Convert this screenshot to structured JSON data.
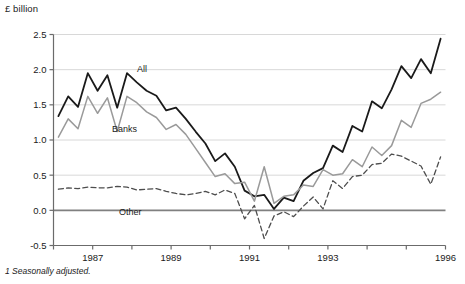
{
  "figure": {
    "unit_label": "£ billion",
    "footnote": "1 Seasonally adjusted."
  },
  "chart_data": {
    "type": "line",
    "title": "",
    "subtitle": "",
    "xlabel": "",
    "ylabel": "£ billion",
    "ylim": [
      -0.5,
      2.5
    ],
    "xlim": [
      1986.25,
      1996.25
    ],
    "yticks": [
      -0.5,
      0.0,
      0.5,
      1.0,
      1.5,
      2.0,
      2.5
    ],
    "ytick_labels": [
      "-0.5",
      "0.0",
      "0.5",
      "1.0",
      "1.5",
      "2.0",
      "2.5"
    ],
    "xticks": [
      1986.25,
      1987.25,
      1988.25,
      1989.25,
      1990.25,
      1991.25,
      1992.25,
      1993.25,
      1994.25,
      1995.25,
      1996.25
    ],
    "xtick_labels": [
      "",
      "1987",
      "",
      "1989",
      "",
      "1991",
      "",
      "1993",
      "",
      "",
      "1996"
    ],
    "grid": true,
    "grid_axis": "y",
    "grid_color": "#d8d8d8",
    "zero_line": true,
    "zero_line_color": "#808080",
    "legend_position": "inline-annotations",
    "annotations": [
      {
        "text": "All",
        "x_px": 137,
        "y_px": 72,
        "series": "All"
      },
      {
        "text": "Banks",
        "x_px": 112,
        "y_px": 132,
        "series": "Banks"
      },
      {
        "text": "Other",
        "x_px": 119,
        "y_px": 215,
        "series": "Other"
      }
    ],
    "x": [
      1986.375,
      1986.625,
      1986.875,
      1987.125,
      1987.375,
      1987.625,
      1987.875,
      1988.125,
      1988.375,
      1988.625,
      1988.875,
      1989.125,
      1989.375,
      1989.625,
      1989.875,
      1990.125,
      1990.375,
      1990.625,
      1990.875,
      1991.125,
      1991.375,
      1991.625,
      1991.875,
      1992.125,
      1992.375,
      1992.625,
      1992.875,
      1993.125,
      1993.375,
      1993.625,
      1993.875,
      1994.125,
      1994.375,
      1994.625,
      1994.875,
      1995.125,
      1995.375,
      1995.625,
      1995.875,
      1996.125
    ],
    "series": [
      {
        "name": "All",
        "style": "solid",
        "color": "#1a1a1a",
        "width": 1.8,
        "values": [
          1.34,
          1.62,
          1.47,
          1.95,
          1.7,
          1.92,
          1.46,
          1.95,
          1.82,
          1.7,
          1.63,
          1.42,
          1.46,
          1.3,
          1.12,
          0.95,
          0.7,
          0.81,
          0.62,
          0.28,
          0.2,
          0.22,
          0.02,
          0.18,
          0.13,
          0.42,
          0.53,
          0.6,
          0.92,
          0.83,
          1.2,
          1.12,
          1.55,
          1.45,
          1.72,
          2.05,
          1.88,
          2.15,
          1.95,
          2.44
        ]
      },
      {
        "name": "Banks",
        "style": "solid",
        "color": "#9a9a9a",
        "width": 1.5,
        "values": [
          1.04,
          1.3,
          1.16,
          1.62,
          1.38,
          1.6,
          1.12,
          1.62,
          1.53,
          1.4,
          1.32,
          1.15,
          1.22,
          1.08,
          0.88,
          0.68,
          0.48,
          0.52,
          0.38,
          0.4,
          0.13,
          0.62,
          0.1,
          0.2,
          0.22,
          0.36,
          0.34,
          0.58,
          0.5,
          0.52,
          0.72,
          0.62,
          0.9,
          0.78,
          0.92,
          1.28,
          1.18,
          1.52,
          1.58,
          1.68
        ]
      },
      {
        "name": "Other",
        "style": "dashed",
        "color": "#4d4d4d",
        "width": 1.3,
        "values": [
          0.3,
          0.32,
          0.31,
          0.33,
          0.32,
          0.32,
          0.34,
          0.33,
          0.29,
          0.3,
          0.31,
          0.27,
          0.24,
          0.22,
          0.24,
          0.27,
          0.22,
          0.29,
          0.24,
          -0.12,
          0.07,
          -0.4,
          -0.08,
          -0.02,
          -0.09,
          0.06,
          0.19,
          0.02,
          0.42,
          0.31,
          0.48,
          0.5,
          0.65,
          0.67,
          0.8,
          0.77,
          0.7,
          0.63,
          0.37,
          0.76
        ]
      }
    ]
  }
}
